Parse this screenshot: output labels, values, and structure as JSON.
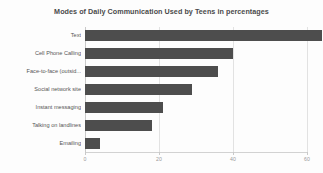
{
  "chart_data": {
    "type": "bar",
    "orientation": "horizontal",
    "title": "Modes of Daily Communication Used by Teens in percentages",
    "xlabel": "",
    "ylabel": "",
    "categories": [
      "Text",
      "Cell Phone Calling",
      "Face-to-face (outsid...",
      "Social network site",
      "Instant messaging",
      "Talking on landlines",
      "Emailing"
    ],
    "values": [
      64,
      40,
      36,
      29,
      21,
      18,
      4
    ],
    "xlim": [
      0,
      60
    ],
    "xticks": [
      0,
      20,
      40,
      60
    ],
    "xticklabels": [
      "0",
      "20",
      "40",
      "60"
    ],
    "grid": true,
    "legend": false,
    "series_color": "#4d4d4d",
    "background_color": "#fdfdfd",
    "gridline_color": "#e2e2e2",
    "title_color": "#4a4a4a",
    "label_color": "#555555"
  }
}
